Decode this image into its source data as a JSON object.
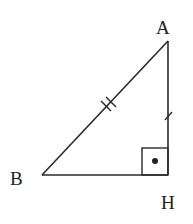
{
  "diagram": {
    "type": "right-triangle",
    "stroke_color": "#2a2a2a",
    "vertices": {
      "A": {
        "label": "A",
        "x": 168,
        "y": 41
      },
      "B": {
        "label": "B",
        "x": 42,
        "y": 175
      },
      "H": {
        "label": "H",
        "x": 168,
        "y": 175
      }
    },
    "labels": {
      "A": "A",
      "B": "B",
      "H": "H"
    },
    "segments": [
      {
        "from": "A",
        "to": "B",
        "tick_marks": 2
      },
      {
        "from": "A",
        "to": "H",
        "tick_marks": 1
      },
      {
        "from": "B",
        "to": "H",
        "tick_marks": 0
      }
    ],
    "right_angle": {
      "at": "H",
      "marker": "square-with-dot"
    }
  }
}
